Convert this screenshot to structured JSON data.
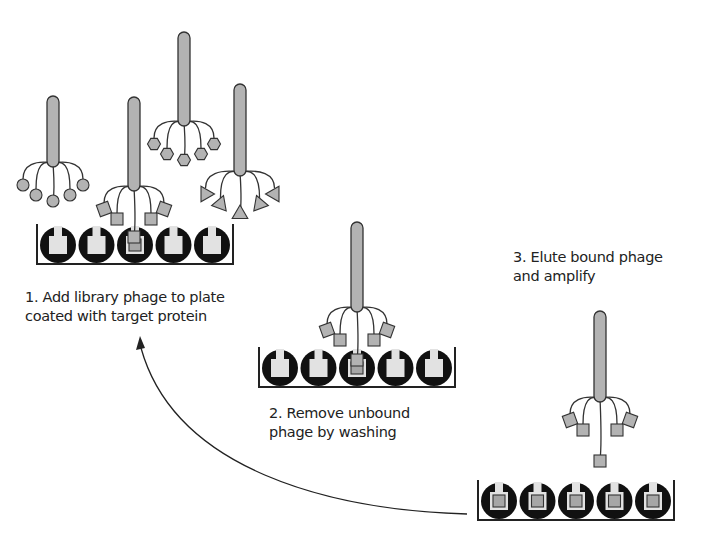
{
  "colors": {
    "phage_fill": "#b3b3b3",
    "stroke": "#333333",
    "well": "#111111",
    "pocket": "#e2e2e2",
    "bound_ligand": "#a6a6a6",
    "background": "#ffffff"
  },
  "steps": [
    {
      "id": "step-1",
      "lines": [
        "1. Add library phage to plate",
        "coated with target protein"
      ],
      "plate": {
        "wells": 5,
        "bound_wells": [
          2
        ]
      },
      "phages": [
        {
          "ligand": "circle"
        },
        {
          "ligand": "square"
        },
        {
          "ligand": "hexagon"
        },
        {
          "ligand": "triangle"
        }
      ]
    },
    {
      "id": "step-2",
      "lines": [
        "2. Remove unbound",
        "phage by washing"
      ],
      "plate": {
        "wells": 5,
        "bound_wells": [
          2
        ]
      },
      "phages": [
        {
          "ligand": "square"
        }
      ]
    },
    {
      "id": "step-3",
      "lines": [
        "3. Elute bound phage",
        "and amplify"
      ],
      "plate": {
        "wells": 5,
        "bound_wells": [
          0,
          1,
          2,
          3,
          4
        ]
      },
      "phages": [
        {
          "ligand": "square"
        }
      ]
    }
  ],
  "cycle_arrow": {
    "from": "step-3",
    "to": "step-1"
  }
}
